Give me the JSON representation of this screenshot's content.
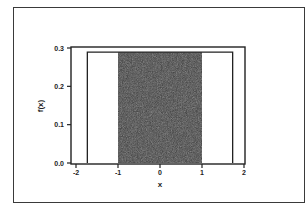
{
  "chart_data": {
    "type": "area",
    "title": "",
    "xlabel": "x",
    "ylabel": "f(x)",
    "xlim": [
      -2.1,
      2.05
    ],
    "ylim": [
      0.0,
      0.3
    ],
    "x_ticks": [
      -2,
      -1,
      0,
      1,
      2
    ],
    "x_tick_labels": [
      "-2",
      "-1",
      "0",
      "1",
      "2"
    ],
    "y_ticks": [
      0.0,
      0.1,
      0.2,
      0.3
    ],
    "y_tick_labels": [
      "0.0",
      "0.1",
      "0.2",
      "0.3"
    ],
    "grid": false,
    "legend": null,
    "series": [
      {
        "name": "uniform density",
        "x": [
          -1.73,
          -1.73,
          1.73,
          1.73
        ],
        "y": [
          0.0,
          0.289,
          0.289,
          0.0
        ],
        "fill": "none",
        "stroke": "#222222"
      },
      {
        "name": "shaded region",
        "x": [
          -1,
          -1,
          1,
          1
        ],
        "y": [
          0.0,
          0.289,
          0.289,
          0.0
        ],
        "fill": "#3c3c3c"
      }
    ],
    "annotations": []
  },
  "colors": {
    "shade": "#3c3c3c",
    "line": "#222222",
    "background": "#ffffff"
  }
}
